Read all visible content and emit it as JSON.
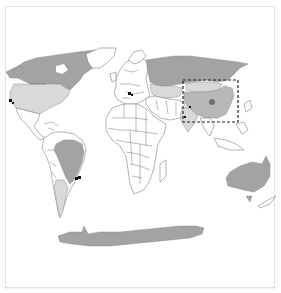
{
  "figure": {
    "caption_partial": "",
    "type": "world-choropleth-map"
  },
  "legend_colors": {
    "highlight_dark": "#a3a3a3",
    "highlight_mid": "#b8b8b8",
    "highlight_light": "#d9d9d9",
    "unshaded": "#ffffff",
    "marker": "#111111",
    "focus_dot": "#6f6f6f",
    "focus_box_stroke": "#222222"
  },
  "regions": {
    "shaded_dark": [
      "Russia",
      "Canada",
      "Brazil",
      "Australia",
      "Antarctica",
      "Greenland-coast"
    ],
    "shaded_light": [
      "United States",
      "Argentina",
      "Kazakhstan",
      "Mongolia",
      "India"
    ],
    "focus": "China"
  },
  "markers": [
    {
      "name": "marker-us-west",
      "x": 11,
      "y": 101
    },
    {
      "name": "marker-europe",
      "x": 130,
      "y": 94
    },
    {
      "name": "marker-brazil-se",
      "x": 77,
      "y": 178
    },
    {
      "name": "marker-south-asia",
      "x": 190,
      "y": 108
    }
  ],
  "focus_box": {
    "x": 183,
    "y": 80,
    "width": 55,
    "height": 42
  }
}
